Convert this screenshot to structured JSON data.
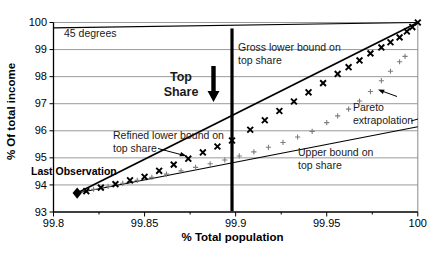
{
  "annotations": {
    "deg45": "45 degrees",
    "gross": "Gross lower bound on\ntop share",
    "top_share": "Top\nShare",
    "refined": "Refined lower bound on\ntop share",
    "last_observation": "Last Observation",
    "upper": "Upper bound on\ntop share",
    "pareto": "Pareto\nextrapolation"
  },
  "chart_data": {
    "type": "scatter",
    "title": "",
    "xlabel": "% Total population",
    "ylabel": "% Of total income",
    "xlim": [
      99.8,
      100
    ],
    "ylim": [
      93,
      100
    ],
    "grid": true,
    "grid_color": "#9a9a9a",
    "x_tick_values": [
      99.8,
      99.85,
      99.9,
      99.95,
      100
    ],
    "x_tick_labels": [
      "99.8",
      "99.85",
      "99.9",
      "99.95",
      "100"
    ],
    "x_minor_ticks": [
      99.825,
      99.875,
      99.925,
      99.975
    ],
    "y_tick_values": [
      93,
      94,
      95,
      96,
      97,
      98,
      99,
      100
    ],
    "y_tick_labels": [
      "93",
      "94",
      "95",
      "96",
      "97",
      "98",
      "99",
      "100"
    ],
    "series": [
      {
        "name": "45 degrees",
        "type": "line",
        "color": "#000000",
        "stroke_width": 1.2,
        "points": [
          [
            99.8,
            99.8
          ],
          [
            100,
            100
          ]
        ]
      },
      {
        "name": "Gross lower bound on top share",
        "type": "line",
        "color": "#000000",
        "stroke_width": 1.8,
        "points": [
          [
            99.813,
            93.7
          ],
          [
            100,
            100
          ]
        ]
      },
      {
        "name": "Upper bound on top share",
        "type": "line",
        "color": "#000000",
        "stroke_width": 1.1,
        "points": [
          [
            99.813,
            93.7
          ],
          [
            100,
            96.15
          ]
        ]
      },
      {
        "name": "Pareto extrapolation",
        "type": "scatter-plus",
        "color": "#7d7d7d",
        "points": [
          [
            99.822,
            93.84
          ],
          [
            99.83,
            93.95
          ],
          [
            99.838,
            94.06
          ],
          [
            99.846,
            94.17
          ],
          [
            99.854,
            94.28
          ],
          [
            99.862,
            94.4
          ],
          [
            99.87,
            94.52
          ],
          [
            99.878,
            94.65
          ],
          [
            99.886,
            94.78
          ],
          [
            99.894,
            94.92
          ],
          [
            99.902,
            95.07
          ],
          [
            99.91,
            95.22
          ],
          [
            99.918,
            95.39
          ],
          [
            99.926,
            95.57
          ],
          [
            99.934,
            95.77
          ],
          [
            99.942,
            95.98
          ],
          [
            99.95,
            96.3
          ],
          [
            99.956,
            96.55
          ],
          [
            99.962,
            96.8
          ],
          [
            99.968,
            97.1
          ],
          [
            99.974,
            97.45
          ],
          [
            99.98,
            97.85
          ],
          [
            99.985,
            98.2
          ],
          [
            99.99,
            98.55
          ],
          [
            99.993,
            98.75
          ]
        ]
      },
      {
        "name": "Refined lower bound on top share",
        "type": "scatter-x",
        "color": "#000000",
        "points": [
          [
            99.818,
            93.77
          ],
          [
            99.826,
            93.9
          ],
          [
            99.834,
            94.03
          ],
          [
            99.842,
            94.17
          ],
          [
            99.85,
            94.3
          ],
          [
            99.858,
            94.52
          ],
          [
            99.866,
            94.75
          ],
          [
            99.874,
            94.97
          ],
          [
            99.882,
            95.2
          ],
          [
            99.89,
            95.42
          ],
          [
            99.898,
            95.64
          ],
          [
            99.908,
            96.04
          ],
          [
            99.916,
            96.39
          ],
          [
            99.924,
            96.73
          ],
          [
            99.932,
            97.08
          ],
          [
            99.94,
            97.42
          ],
          [
            99.948,
            97.76
          ],
          [
            99.956,
            98.1
          ],
          [
            99.962,
            98.35
          ],
          [
            99.968,
            98.6
          ],
          [
            99.974,
            98.86
          ],
          [
            99.98,
            99.08
          ],
          [
            99.985,
            99.27
          ],
          [
            99.99,
            99.45
          ],
          [
            99.994,
            99.67
          ],
          [
            99.997,
            99.83
          ],
          [
            100,
            100
          ]
        ]
      },
      {
        "name": "Last observation",
        "type": "diamond",
        "color": "#000000",
        "points": [
          [
            99.813,
            93.7
          ]
        ]
      },
      {
        "name": "Top share indicator line",
        "type": "vline",
        "color": "#000000",
        "stroke_width": 3.2,
        "x": 99.898,
        "y_range": [
          93.03,
          99.78
        ]
      }
    ]
  }
}
